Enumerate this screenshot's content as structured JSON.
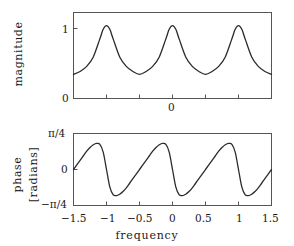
{
  "figure": {
    "width": 294,
    "height": 246,
    "background": "#ffffff",
    "line_color": "#2b2b2b",
    "frame_color": "#555555"
  },
  "panels": {
    "top": {
      "ylabel": "magnitude",
      "ytick_labels": [
        "1",
        "0"
      ],
      "xtick_label_zero": "0"
    },
    "bottom": {
      "ylabel_line1": "phase",
      "ylabel_line2": "[radians]",
      "ytick_top": "π/4",
      "ytick_mid": "0",
      "ytick_bottom": "−π/4",
      "xlabel": "frequency",
      "xtick_labels": [
        "−1.5",
        "−1",
        "−0.5",
        "0",
        "0.5",
        "1",
        "1.5"
      ]
    }
  },
  "chart_data": [
    {
      "type": "line",
      "id": "magnitude-plot",
      "title": "",
      "xlabel": "",
      "ylabel": "magnitude",
      "xlim": [
        -1.5,
        1.5
      ],
      "ylim": [
        0,
        1.18
      ],
      "grid": false,
      "legend": null,
      "xticks": [
        -1,
        -0.5,
        0,
        0.5,
        1
      ],
      "xticklabels": [
        "",
        "",
        "0",
        "",
        ""
      ],
      "yticks": [
        0,
        1
      ],
      "yticklabels": [
        "0",
        "1"
      ],
      "description": "Periodic comb-like magnitude response with unity peaks at frequency -1, 0 and 1 and minima near 0.30 at -0.5 and 0.5.",
      "x": [
        -1.5,
        -1.4,
        -1.3,
        -1.2,
        -1.1,
        -1.05,
        -1.0,
        -0.95,
        -0.9,
        -0.8,
        -0.7,
        -0.6,
        -0.5,
        -0.4,
        -0.3,
        -0.2,
        -0.1,
        -0.05,
        0.0,
        0.05,
        0.1,
        0.2,
        0.3,
        0.4,
        0.5,
        0.6,
        0.7,
        0.8,
        0.9,
        0.95,
        1.0,
        1.05,
        1.1,
        1.2,
        1.3,
        1.4,
        1.5
      ],
      "y": [
        0.33,
        0.37,
        0.44,
        0.57,
        0.82,
        0.95,
        1.0,
        0.95,
        0.82,
        0.57,
        0.44,
        0.37,
        0.33,
        0.37,
        0.44,
        0.57,
        0.82,
        0.95,
        1.0,
        0.95,
        0.82,
        0.57,
        0.44,
        0.37,
        0.33,
        0.37,
        0.44,
        0.57,
        0.82,
        0.95,
        1.0,
        0.95,
        0.82,
        0.57,
        0.44,
        0.37,
        0.33
      ]
    },
    {
      "type": "line",
      "id": "phase-plot",
      "title": "",
      "xlabel": "frequency",
      "ylabel": "phase [radians]",
      "xlim": [
        -1.5,
        1.5
      ],
      "ylim": [
        -0.7853981634,
        0.7853981634
      ],
      "grid": false,
      "legend": null,
      "xticks": [
        -1.5,
        -1,
        -0.5,
        0,
        0.5,
        1,
        1.5
      ],
      "xticklabels": [
        "−1.5",
        "−1",
        "−0.5",
        "0",
        "0.5",
        "1",
        "1.5"
      ],
      "yticks": [
        -0.7853981634,
        0,
        0.7853981634
      ],
      "yticklabels": [
        "−π/4",
        "0",
        "π/4"
      ],
      "description": "Sawtooth-like periodic phase response, period 1, rising through zero at integer frequencies, peaking near +0.57 rad just after and dipping to about -0.57 rad just before each zero crossing.",
      "x": [
        -1.5,
        -1.45,
        -1.4,
        -1.35,
        -1.3,
        -1.25,
        -1.2,
        -1.15,
        -1.1,
        -1.05,
        -1.0,
        -0.95,
        -0.9,
        -0.85,
        -0.8,
        -0.75,
        -0.7,
        -0.65,
        -0.6,
        -0.55,
        -0.5,
        -0.45,
        -0.4,
        -0.35,
        -0.3,
        -0.25,
        -0.2,
        -0.15,
        -0.1,
        -0.05,
        0.0,
        0.05,
        0.1,
        0.15,
        0.2,
        0.25,
        0.3,
        0.35,
        0.4,
        0.45,
        0.5,
        0.55,
        0.6,
        0.65,
        0.7,
        0.75,
        0.8,
        0.85,
        0.9,
        0.95,
        1.0,
        1.05,
        1.1,
        1.15,
        1.2,
        1.25,
        1.3,
        1.35,
        1.4,
        1.45,
        1.5
      ],
      "y": [
        0.0,
        0.1,
        0.2,
        0.3,
        0.4,
        0.48,
        0.54,
        0.57,
        0.55,
        0.38,
        0.0,
        -0.38,
        -0.55,
        -0.57,
        -0.54,
        -0.48,
        -0.4,
        -0.3,
        -0.2,
        -0.1,
        0.0,
        0.1,
        0.2,
        0.3,
        0.4,
        0.48,
        0.54,
        0.57,
        0.55,
        0.38,
        0.0,
        -0.38,
        -0.55,
        -0.57,
        -0.54,
        -0.48,
        -0.4,
        -0.3,
        -0.2,
        -0.1,
        0.0,
        0.1,
        0.2,
        0.3,
        0.4,
        0.48,
        0.54,
        0.57,
        0.55,
        0.38,
        0.0,
        -0.38,
        -0.55,
        -0.57,
        -0.54,
        -0.48,
        -0.4,
        -0.3,
        -0.2,
        -0.1,
        0.0
      ]
    }
  ]
}
